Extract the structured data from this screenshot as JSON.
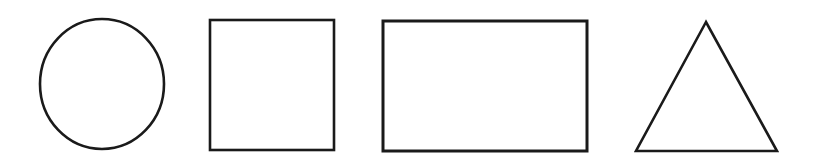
{
  "figure": {
    "background": "#ffffff",
    "stroke_color": "#1a1a1a",
    "shapes": [
      {
        "type": "circle",
        "label": "circle",
        "cx": 102,
        "cy": 84,
        "rx": 62,
        "ry": 65
      },
      {
        "type": "square",
        "label": "square",
        "x": 210,
        "y": 20,
        "width": 124,
        "height": 130
      },
      {
        "type": "rectangle",
        "label": "rectangle",
        "x": 383,
        "y": 21,
        "width": 204,
        "height": 130
      },
      {
        "type": "triangle",
        "label": "triangle",
        "points": "706,22 636,151 777,151"
      }
    ]
  }
}
